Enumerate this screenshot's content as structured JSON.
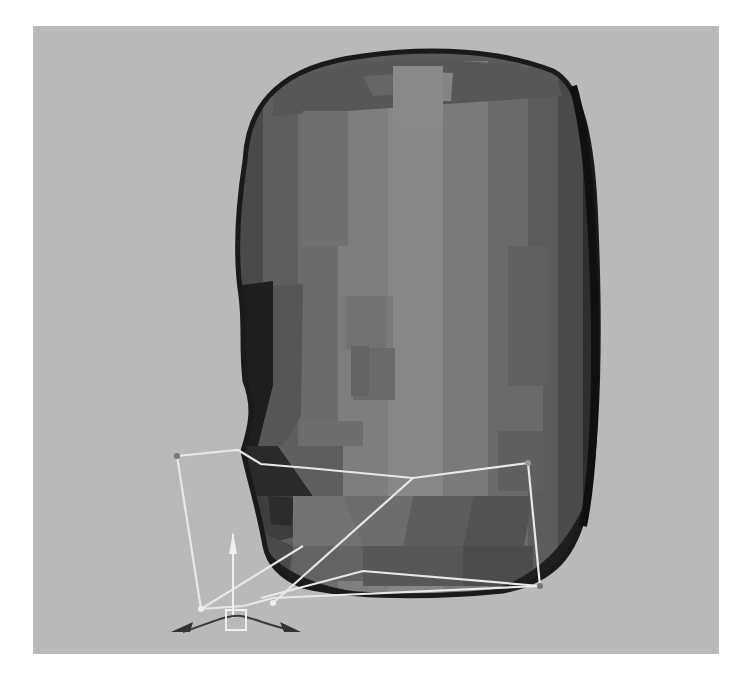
{
  "viewport": {
    "label": "3D perspective viewport",
    "background_color": "#b9b9b9",
    "object": {
      "name": "low-poly head mesh",
      "shading": "flat shaded",
      "colors": {
        "outline": "#1a1a1a",
        "dark": "#3c3c3c",
        "mid_dark": "#5a5a5a",
        "mid": "#707070",
        "light": "#858585",
        "highlight": "#8c8c8c"
      }
    },
    "lattice": {
      "name": "deformer lattice cage",
      "color": "#e8e8e8"
    },
    "manipulator": {
      "name": "move manipulator gizmo",
      "color": "#f0f0f0",
      "arrow_color": "#333333"
    }
  }
}
